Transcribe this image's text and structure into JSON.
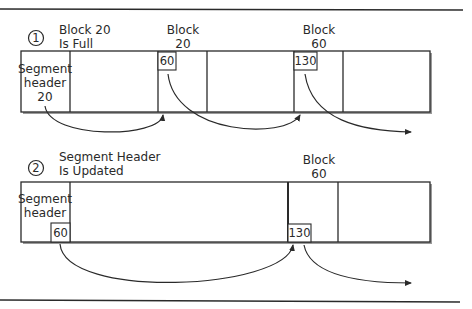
{
  "diagram": {
    "step1": {
      "number": "1",
      "caption_line1": "Block 20",
      "caption_line2": "Is Full",
      "segment_header": {
        "line1": "Segment",
        "line2": "header",
        "line3": "20"
      },
      "block_labels": [
        {
          "line1": "Block",
          "line2": "20"
        },
        {
          "line1": "Block",
          "line2": "60"
        }
      ],
      "pointers": [
        "60",
        "130"
      ]
    },
    "step2": {
      "number": "2",
      "caption_line1": "Segment Header",
      "caption_line2": "Is Updated",
      "segment_header": {
        "line1": "Segment",
        "line2": "header"
      },
      "header_pointer": "60",
      "block_labels": [
        {
          "line1": "Block",
          "line2": "60"
        }
      ],
      "pointers": [
        "130"
      ]
    },
    "colors": {
      "ink": "#2a2a2a",
      "background": "#ffffff"
    }
  }
}
